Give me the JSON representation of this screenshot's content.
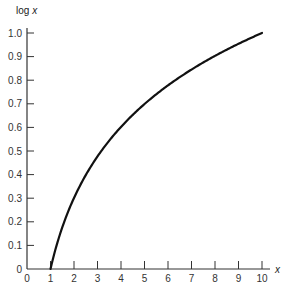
{
  "chart_data": {
    "type": "line",
    "title": "",
    "xlabel": "x",
    "ylabel": "log x",
    "xlim": [
      0,
      10
    ],
    "ylim": [
      0,
      1.0
    ],
    "grid": false,
    "legend": null,
    "x_ticks": [
      "0",
      "1",
      "2",
      "3",
      "4",
      "5",
      "6",
      "7",
      "8",
      "9",
      "10"
    ],
    "y_ticks": [
      "0",
      "0.1",
      "0.2",
      "0.3",
      "0.4",
      "0.5",
      "0.6",
      "0.7",
      "0.8",
      "0.9",
      "1.0"
    ],
    "series": [
      {
        "name": "log x",
        "x": [
          1,
          1.5,
          2,
          2.5,
          3,
          3.5,
          4,
          4.5,
          5,
          5.5,
          6,
          6.5,
          7,
          7.5,
          8,
          8.5,
          9,
          9.5,
          10
        ],
        "values": [
          0,
          0.176,
          0.301,
          0.398,
          0.477,
          0.544,
          0.602,
          0.653,
          0.699,
          0.74,
          0.778,
          0.813,
          0.845,
          0.875,
          0.903,
          0.929,
          0.954,
          0.978,
          1.0
        ]
      }
    ]
  }
}
